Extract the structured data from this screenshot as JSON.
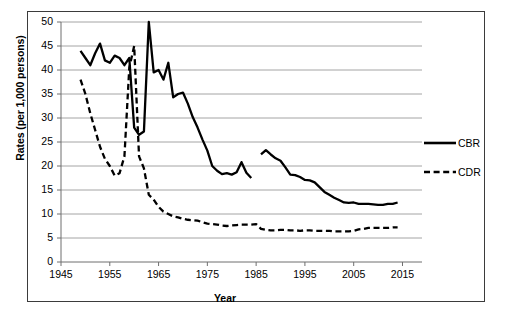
{
  "chart_data": {
    "type": "line",
    "title": "",
    "xlabel": "Year",
    "ylabel": "Rates (per 1,000 persons)",
    "xlim": [
      1945,
      2019
    ],
    "ylim": [
      0,
      50
    ],
    "xticks": [
      1945,
      1955,
      1965,
      1975,
      1985,
      1995,
      2005,
      2015
    ],
    "yticks": [
      0,
      5,
      10,
      15,
      20,
      25,
      30,
      35,
      40,
      45,
      50
    ],
    "grid": "horizontal",
    "legend_position": "right-middle",
    "series": [
      {
        "name": "CBR",
        "style": "solid",
        "color": "#000000",
        "x": [
          1949,
          1950,
          1951,
          1952,
          1953,
          1954,
          1955,
          1956,
          1957,
          1958,
          1959,
          1960,
          1961,
          1962,
          1963,
          1964,
          1965,
          1966,
          1967,
          1968,
          1969,
          1970,
          1971,
          1972,
          1973,
          1974,
          1975,
          1976,
          1977,
          1978,
          1979,
          1980,
          1981,
          1982,
          1983,
          1984,
          1986,
          1987,
          1988,
          1989,
          1990,
          1991,
          1992,
          1993,
          1994,
          1995,
          1996,
          1997,
          1998,
          1999,
          2000,
          2001,
          2002,
          2003,
          2004,
          2005,
          2006,
          2007,
          2008,
          2009,
          2010,
          2011,
          2012,
          2013,
          2014
        ],
        "y": [
          44.0,
          42.5,
          41.0,
          43.5,
          45.5,
          42.0,
          41.5,
          43.0,
          42.5,
          41.0,
          42.5,
          28.0,
          26.5,
          27.2,
          50.0,
          39.5,
          40.0,
          38.0,
          41.5,
          34.3,
          35.0,
          35.3,
          33.0,
          30.2,
          28.0,
          25.5,
          23.2,
          20.0,
          19.0,
          18.3,
          18.5,
          18.2,
          18.7,
          20.8,
          18.6,
          17.5,
          22.4,
          23.3,
          22.4,
          21.6,
          21.1,
          19.7,
          18.2,
          18.1,
          17.7,
          17.1,
          17.0,
          16.6,
          15.6,
          14.6,
          14.0,
          13.4,
          12.9,
          12.4,
          12.3,
          12.4,
          12.1,
          12.1,
          12.1,
          12.0,
          11.9,
          11.9,
          12.1,
          12.1,
          12.4
        ]
      },
      {
        "name": "CDR",
        "style": "dashed",
        "color": "#000000",
        "x": [
          1949,
          1950,
          1951,
          1952,
          1953,
          1954,
          1955,
          1956,
          1957,
          1958,
          1959,
          1960,
          1961,
          1962,
          1963,
          1964,
          1965,
          1966,
          1967,
          1968,
          1969,
          1970,
          1971,
          1972,
          1973,
          1974,
          1975,
          1976,
          1977,
          1978,
          1979,
          1980,
          1981,
          1982,
          1983,
          1984,
          1985,
          1986,
          1987,
          1988,
          1989,
          1990,
          1991,
          1992,
          1993,
          1994,
          1995,
          1996,
          1997,
          1998,
          1999,
          2000,
          2001,
          2002,
          2003,
          2004,
          2005,
          2006,
          2007,
          2008,
          2009,
          2010,
          2011,
          2012,
          2013,
          2014
        ],
        "y": [
          38.0,
          35.0,
          31.0,
          27.5,
          24.0,
          21.5,
          20.0,
          18.0,
          18.5,
          22.0,
          40.5,
          45.0,
          22.0,
          19.5,
          14.0,
          13.0,
          11.5,
          10.5,
          10.0,
          9.5,
          9.3,
          9.0,
          8.8,
          8.7,
          8.6,
          8.3,
          8.0,
          7.9,
          7.8,
          7.6,
          7.5,
          7.6,
          7.7,
          7.8,
          7.8,
          7.8,
          7.9,
          6.9,
          6.7,
          6.6,
          6.6,
          6.7,
          6.7,
          6.6,
          6.6,
          6.5,
          6.6,
          6.6,
          6.5,
          6.5,
          6.5,
          6.5,
          6.4,
          6.4,
          6.4,
          6.4,
          6.5,
          6.8,
          6.9,
          7.1,
          7.1,
          7.1,
          7.1,
          7.1,
          7.2,
          7.2
        ]
      }
    ]
  },
  "axis": {
    "y_title": "Rates (per 1,000 persons)",
    "x_title": "Year",
    "y_tick_labels": [
      "50",
      "45",
      "40",
      "35",
      "30",
      "25",
      "20",
      "15",
      "10",
      "5",
      "0"
    ],
    "x_tick_labels": [
      "1945",
      "1955",
      "1965",
      "1975",
      "1985",
      "1995",
      "2005",
      "2015"
    ]
  },
  "legend": {
    "items": [
      {
        "label": "CBR",
        "style": "solid"
      },
      {
        "label": "CDR",
        "style": "dashed"
      }
    ]
  }
}
